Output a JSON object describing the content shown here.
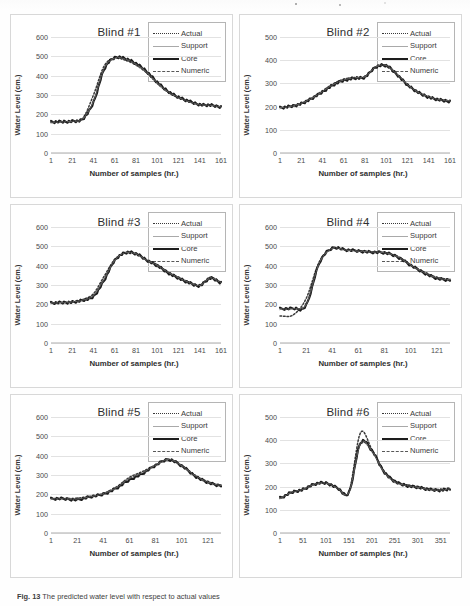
{
  "figure": {
    "caption_label": "Fig. 13",
    "caption_text": "The predicted water level with respect to actual values"
  },
  "legend": {
    "position": "top-right",
    "entries": [
      {
        "name": "actual",
        "label": "Actual",
        "style": "dotted",
        "color": "#3a3a3a"
      },
      {
        "name": "support",
        "label": "Support",
        "style": "thin-solid",
        "color": "#a9a9a9"
      },
      {
        "name": "core",
        "label": "Core",
        "style": "thick-solid",
        "color": "#1d1d1d"
      },
      {
        "name": "numeric",
        "label": "Numeric",
        "style": "dash-dot",
        "color": "#585858"
      }
    ]
  },
  "axis_labels": {
    "y": "Water Level (cm.)",
    "x": "Number of samples (hr.)"
  },
  "chart_data": [
    {
      "type": "line",
      "title": "Blind #1",
      "xlabel": "Number of samples (hr.)",
      "ylabel": "Water Level (cm.)",
      "grid": true,
      "legend_position": "top-right",
      "xlim": [
        1,
        161
      ],
      "ylim": [
        0,
        600
      ],
      "yticks": [
        0,
        100,
        200,
        300,
        400,
        500,
        600
      ],
      "xticks": [
        1,
        21,
        41,
        61,
        81,
        101,
        121,
        141,
        161
      ],
      "x": [
        1,
        11,
        21,
        31,
        41,
        51,
        61,
        71,
        81,
        91,
        101,
        111,
        121,
        131,
        141,
        151,
        161
      ],
      "series": [
        {
          "name": "Actual",
          "values": [
            158,
            160,
            163,
            180,
            300,
            450,
            492,
            480,
            455,
            415,
            360,
            315,
            285,
            265,
            250,
            248,
            240
          ]
        },
        {
          "name": "Support",
          "values": [
            160,
            161,
            164,
            175,
            265,
            435,
            490,
            486,
            460,
            420,
            365,
            318,
            288,
            266,
            250,
            246,
            238
          ]
        },
        {
          "name": "Core",
          "values": [
            160,
            162,
            165,
            176,
            262,
            432,
            493,
            488,
            462,
            422,
            366,
            320,
            289,
            267,
            251,
            247,
            239
          ]
        },
        {
          "name": "Numeric",
          "values": [
            159,
            161,
            164,
            177,
            268,
            438,
            491,
            485,
            459,
            418,
            363,
            317,
            287,
            265,
            250,
            247,
            239
          ]
        }
      ]
    },
    {
      "type": "line",
      "title": "Blind #2",
      "xlabel": "Number of samples (hr.)",
      "ylabel": "Water Level (cm.)",
      "grid": true,
      "legend_position": "top-right",
      "xlim": [
        1,
        161
      ],
      "ylim": [
        0,
        500
      ],
      "yticks": [
        0,
        100,
        200,
        300,
        400,
        500
      ],
      "xticks": [
        1,
        21,
        41,
        61,
        81,
        101,
        121,
        141,
        161
      ],
      "x": [
        1,
        11,
        21,
        31,
        41,
        51,
        61,
        71,
        81,
        91,
        101,
        111,
        121,
        131,
        141,
        151,
        161
      ],
      "series": [
        {
          "name": "Actual",
          "values": [
            196,
            202,
            215,
            238,
            268,
            298,
            318,
            325,
            330,
            372,
            378,
            340,
            295,
            262,
            242,
            230,
            226
          ]
        },
        {
          "name": "Support",
          "values": [
            194,
            200,
            212,
            234,
            262,
            292,
            312,
            322,
            326,
            368,
            375,
            338,
            293,
            260,
            240,
            228,
            222
          ]
        },
        {
          "name": "Core",
          "values": [
            195,
            201,
            213,
            235,
            263,
            293,
            313,
            323,
            327,
            370,
            376,
            339,
            294,
            261,
            241,
            229,
            223
          ]
        },
        {
          "name": "Numeric",
          "values": [
            196,
            201,
            214,
            236,
            265,
            295,
            315,
            324,
            329,
            371,
            377,
            340,
            295,
            262,
            242,
            230,
            225
          ]
        }
      ]
    },
    {
      "type": "line",
      "title": "Blind #3",
      "xlabel": "Number of samples (hr.)",
      "ylabel": "Water Level (cm.)",
      "grid": true,
      "legend_position": "top-right",
      "xlim": [
        1,
        161
      ],
      "ylim": [
        0,
        600
      ],
      "yticks": [
        0,
        100,
        200,
        300,
        400,
        500,
        600
      ],
      "xticks": [
        1,
        21,
        41,
        61,
        81,
        101,
        121,
        141,
        161
      ],
      "x": [
        1,
        11,
        21,
        31,
        41,
        51,
        61,
        71,
        81,
        91,
        101,
        111,
        121,
        131,
        141,
        151,
        161
      ],
      "series": [
        {
          "name": "Actual",
          "values": [
            208,
            210,
            214,
            225,
            255,
            345,
            432,
            468,
            462,
            430,
            405,
            368,
            340,
            315,
            300,
            340,
            315
          ]
        },
        {
          "name": "Support",
          "values": [
            206,
            208,
            211,
            220,
            240,
            322,
            425,
            466,
            460,
            428,
            398,
            362,
            335,
            310,
            296,
            332,
            312
          ]
        },
        {
          "name": "Core",
          "values": [
            207,
            209,
            212,
            221,
            241,
            324,
            427,
            467,
            461,
            429,
            400,
            364,
            336,
            311,
            297,
            335,
            313
          ]
        },
        {
          "name": "Numeric",
          "values": [
            207,
            209,
            213,
            222,
            246,
            330,
            428,
            467,
            461,
            429,
            402,
            366,
            338,
            313,
            298,
            337,
            314
          ]
        }
      ]
    },
    {
      "type": "line",
      "title": "Blind #4",
      "xlabel": "Number of samples (hr.)",
      "ylabel": "Water Level (cm.)",
      "grid": true,
      "legend_position": "top-right",
      "xlim": [
        1,
        131
      ],
      "ylim": [
        0,
        600
      ],
      "yticks": [
        0,
        100,
        200,
        300,
        400,
        500,
        600
      ],
      "xticks": [
        1,
        21,
        41,
        61,
        81,
        101,
        121
      ],
      "x": [
        1,
        11,
        21,
        31,
        41,
        51,
        61,
        71,
        81,
        91,
        101,
        111,
        121,
        131
      ],
      "series": [
        {
          "name": "Actual",
          "values": [
            140,
            145,
            230,
            420,
            490,
            482,
            478,
            472,
            468,
            448,
            405,
            368,
            340,
            330
          ]
        },
        {
          "name": "Support",
          "values": [
            176,
            178,
            195,
            408,
            488,
            480,
            474,
            470,
            466,
            444,
            400,
            362,
            334,
            324
          ]
        },
        {
          "name": "Core",
          "values": [
            177,
            179,
            196,
            412,
            490,
            482,
            476,
            470,
            466,
            445,
            402,
            364,
            335,
            325
          ]
        },
        {
          "name": "Numeric",
          "values": [
            176,
            178,
            200,
            414,
            489,
            481,
            475,
            471,
            467,
            446,
            403,
            365,
            337,
            327
          ]
        }
      ]
    },
    {
      "type": "line",
      "title": "Blind #5",
      "xlabel": "Number of samples (hr.)",
      "ylabel": "Water Level (cm.)",
      "grid": true,
      "legend_position": "top-right",
      "xlim": [
        1,
        131
      ],
      "ylim": [
        0,
        600
      ],
      "yticks": [
        0,
        100,
        200,
        300,
        400,
        500,
        600
      ],
      "xticks": [
        1,
        21,
        41,
        61,
        81,
        101,
        121
      ],
      "x": [
        1,
        11,
        21,
        31,
        41,
        51,
        61,
        71,
        81,
        91,
        101,
        111,
        121,
        131
      ],
      "series": [
        {
          "name": "Actual",
          "values": [
            178,
            178,
            180,
            190,
            205,
            238,
            288,
            318,
            352,
            382,
            350,
            300,
            265,
            248
          ]
        },
        {
          "name": "Support",
          "values": [
            176,
            176,
            172,
            186,
            200,
            230,
            272,
            305,
            348,
            378,
            345,
            294,
            260,
            243
          ]
        },
        {
          "name": "Core",
          "values": [
            177,
            177,
            173,
            187,
            201,
            232,
            275,
            308,
            350,
            380,
            347,
            296,
            262,
            244
          ]
        },
        {
          "name": "Numeric",
          "values": [
            177,
            177,
            176,
            188,
            203,
            235,
            282,
            312,
            351,
            381,
            348,
            298,
            263,
            246
          ]
        }
      ]
    },
    {
      "type": "line",
      "title": "Blind #6",
      "xlabel": "Number of samples (hr.)",
      "ylabel": "Water Level (cm.)",
      "grid": true,
      "legend_position": "top-right",
      "xlim": [
        1,
        371
      ],
      "ylim": [
        0,
        500
      ],
      "yticks": [
        0,
        100,
        200,
        300,
        400,
        500
      ],
      "xticks": [
        1,
        51,
        101,
        151,
        201,
        251,
        301,
        351
      ],
      "x": [
        1,
        26,
        51,
        76,
        101,
        126,
        151,
        176,
        201,
        226,
        251,
        276,
        301,
        326,
        351,
        371
      ],
      "series": [
        {
          "name": "Actual",
          "values": [
            150,
            175,
            188,
            210,
            215,
            195,
            176,
            432,
            360,
            272,
            225,
            208,
            200,
            190,
            188,
            192
          ]
        },
        {
          "name": "Support",
          "values": [
            150,
            174,
            187,
            209,
            214,
            193,
            174,
            382,
            352,
            266,
            220,
            204,
            196,
            186,
            184,
            189
          ]
        },
        {
          "name": "Core",
          "values": [
            151,
            175,
            188,
            210,
            215,
            194,
            175,
            388,
            355,
            268,
            222,
            205,
            197,
            187,
            185,
            190
          ]
        },
        {
          "name": "Numeric",
          "values": [
            150,
            175,
            188,
            210,
            215,
            194,
            175,
            386,
            354,
            267,
            221,
            205,
            197,
            187,
            185,
            190
          ]
        }
      ]
    }
  ]
}
